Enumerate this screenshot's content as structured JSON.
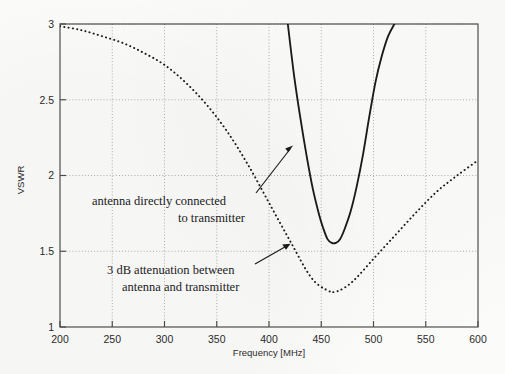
{
  "chart_data": {
    "type": "line",
    "title": "",
    "xlabel": "Frequency [MHz]",
    "ylabel": "VSWR",
    "xlim": [
      200,
      600
    ],
    "ylim": [
      1,
      3
    ],
    "xticks": [
      200,
      250,
      300,
      350,
      400,
      450,
      500,
      550,
      600
    ],
    "xtick_labels": [
      "200",
      "250",
      "300",
      "350",
      "400",
      "450",
      "500",
      "550",
      "600"
    ],
    "yticks": [
      1,
      1.5,
      2,
      2.5,
      3
    ],
    "ytick_labels": [
      "1",
      "1.5",
      "2",
      "2.5",
      "3"
    ],
    "grid": true,
    "legend_position": "none",
    "series": [
      {
        "name": "antenna directly connected to transmitter",
        "style": "solid",
        "color": "#1a1a1a",
        "note": "clipped above VSWR = 3",
        "x": [
          418,
          424,
          430,
          436,
          442,
          448,
          452,
          456,
          460,
          464,
          468,
          472,
          478,
          484,
          490,
          496,
          502,
          508,
          514,
          520
        ],
        "y": [
          3.0,
          2.66,
          2.38,
          2.13,
          1.91,
          1.74,
          1.65,
          1.58,
          1.555,
          1.555,
          1.58,
          1.64,
          1.76,
          1.93,
          2.14,
          2.39,
          2.62,
          2.79,
          2.92,
          3.0
        ]
      },
      {
        "name": "3 dB attenuation between antenna and transmitter",
        "style": "dotted",
        "color": "#1a1a1a",
        "x": [
          200,
          220,
          240,
          260,
          280,
          300,
          320,
          340,
          360,
          380,
          400,
          420,
          440,
          455,
          465,
          480,
          500,
          520,
          540,
          560,
          580,
          600
        ],
        "y": [
          2.985,
          2.96,
          2.92,
          2.875,
          2.81,
          2.73,
          2.615,
          2.47,
          2.29,
          2.07,
          1.82,
          1.57,
          1.33,
          1.245,
          1.235,
          1.3,
          1.45,
          1.6,
          1.75,
          1.89,
          2.0,
          2.1
        ]
      }
    ],
    "annotations": [
      {
        "id": "annot-direct",
        "lines": [
          "antenna directly connected",
          "to transmitter"
        ],
        "text_anchor_xy": [
          255,
          196
        ],
        "arrow_to_xy": [
          293,
          146
        ]
      },
      {
        "id": "annot-attenuated",
        "lines": [
          "3 dB attenuation between",
          "antenna and transmitter"
        ],
        "text_anchor_xy": [
          252,
          266
        ],
        "arrow_to_xy": [
          290,
          243
        ]
      }
    ]
  },
  "figure": {
    "background_color": "#fbfbfa",
    "frame_color": "#4a4a4a",
    "grid_color": "#9a9a9a",
    "ink_color": "#1a1a1a"
  }
}
